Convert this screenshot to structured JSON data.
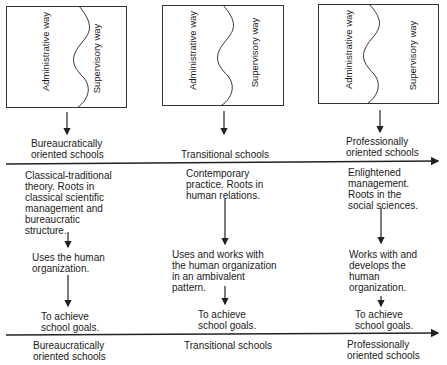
{
  "columns": [
    {
      "id": "bureaucratic",
      "box": {
        "left_label": "Administrative way",
        "right_label": "Supervisory way"
      },
      "top_label": "Bureaucratically\noriented schools",
      "theory": "Classical-traditional\ntheory. Roots in\nclassical scientific\nmanagement and\nbureaucratic\nstructure.",
      "relation": "Uses the human\norganization.",
      "goal": "To achieve\nschool goals.",
      "bottom_label": "Bureaucratically\noriented schools"
    },
    {
      "id": "transitional",
      "box": {
        "left_label": "Administrative way",
        "right_label": "Supervisory way"
      },
      "top_label": "Transitional schools",
      "theory": "Contemporary\npractice. Roots in\nhuman relations.",
      "relation": "Uses and works with\nthe human organization\nin an ambivalent\npattern.",
      "goal": "To achieve\nschool goals.",
      "bottom_label": "Transitional schools"
    },
    {
      "id": "professional",
      "box": {
        "left_label": "Administrative way",
        "right_label": "Supervisory way"
      },
      "top_label": "Professionally\noriented schools",
      "theory": "Enlightened\nmanagement.\nRoots in the\nsocial sciences.",
      "relation": "Works with and\ndevelops the\nhuman\norganization.",
      "goal": "To achieve\nschool goals.",
      "bottom_label": "Professionally\noriented schools"
    }
  ],
  "colors": {
    "line": "#222222",
    "text": "#1a1a1a",
    "background": "#ffffff"
  }
}
